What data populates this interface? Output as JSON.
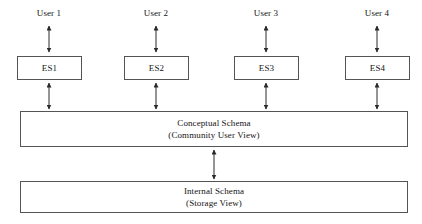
{
  "diagram": {
    "canvas": {
      "width": 422,
      "height": 224,
      "background": "#ffffff"
    },
    "line_color": "#545454",
    "arrow_color": "#2b2b2b",
    "users": [
      {
        "label": "User 1"
      },
      {
        "label": "User 2"
      },
      {
        "label": "User 3"
      },
      {
        "label": "User 4"
      }
    ],
    "external_schemas": [
      {
        "label": "ES1"
      },
      {
        "label": "ES2"
      },
      {
        "label": "ES3"
      },
      {
        "label": "ES4"
      }
    ],
    "conceptual_schema": {
      "line1": "Conceptual Schema",
      "line2": "(Community User View)"
    },
    "internal_schema": {
      "line1": "Internal Schema",
      "line2": "(Storage View)"
    },
    "connectors": [
      {
        "name": "user1-to-es1",
        "kind": "double-headed-arrow"
      },
      {
        "name": "user2-to-es2",
        "kind": "double-headed-arrow"
      },
      {
        "name": "user3-to-es3",
        "kind": "double-headed-arrow"
      },
      {
        "name": "user4-to-es4",
        "kind": "double-headed-arrow"
      },
      {
        "name": "es1-to-conceptual",
        "kind": "double-headed-arrow"
      },
      {
        "name": "es2-to-conceptual",
        "kind": "double-headed-arrow"
      },
      {
        "name": "es3-to-conceptual",
        "kind": "double-headed-arrow"
      },
      {
        "name": "es4-to-conceptual",
        "kind": "double-headed-arrow"
      },
      {
        "name": "conceptual-to-internal",
        "kind": "double-headed-arrow"
      }
    ]
  }
}
